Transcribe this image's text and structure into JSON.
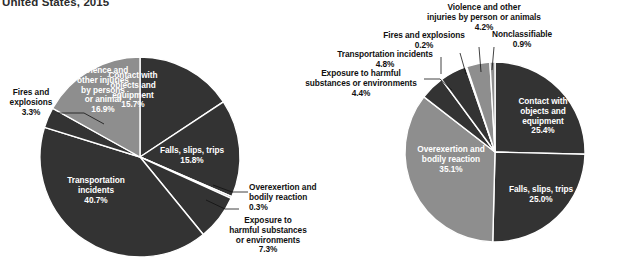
{
  "title": "United States, 2015",
  "colors": {
    "dark": "#333333",
    "light": "#8e8e8e",
    "separator": "#ffffff",
    "label_out": "#111111",
    "label_in": "#ffffff",
    "background": "#ffffff"
  },
  "chart_data": [
    {
      "type": "pie",
      "title": "Fatal occupational injuries by event",
      "name": "left-pie",
      "categories": [
        "Contact with objects and equipment",
        "Falls, slips, trips",
        "Overexertion and bodily reaction",
        "Exposure to harmful substances or environments",
        "Transportation incidents",
        "Fires and explosions",
        "Violence and other injuries by persons or animal"
      ],
      "values": [
        15.7,
        15.8,
        0.3,
        7.3,
        40.7,
        3.3,
        16.9
      ],
      "value_labels": [
        "15.7%",
        "15.8%",
        "0.3%",
        "7.3%",
        "40.7%",
        "3.3%",
        "16.9%"
      ],
      "slice_shades": [
        "dark",
        "dark",
        "light",
        "dark",
        "dark",
        "dark",
        "light"
      ],
      "start_angle": 0,
      "legend": "none"
    },
    {
      "type": "pie",
      "title": "Nonfatal occupational injuries by event",
      "name": "right-pie",
      "categories": [
        "Contact with objects and equipment",
        "Falls, slips, trips",
        "Overexertion and bodily reaction",
        "Exposure to harmful substances or environments",
        "Transportation incidents",
        "Fires and explosions",
        "Violence and other injuries by person or animals",
        "Nonclassifiable"
      ],
      "values": [
        25.4,
        25.0,
        35.1,
        4.4,
        4.8,
        0.2,
        4.2,
        0.9
      ],
      "value_labels": [
        "25.4%",
        "25.0%",
        "35.1%",
        "4.4%",
        "4.8%",
        "0.2%",
        "4.2%",
        "0.9%"
      ],
      "slice_shades": [
        "dark",
        "dark",
        "light",
        "dark",
        "dark",
        "light",
        "light",
        "light"
      ],
      "start_angle": 0,
      "legend": "none"
    }
  ],
  "left_labels": {
    "contact": "Contact with\nobjects and\nequipment\n15.7%",
    "falls": "Falls, slips, trips\n15.8%",
    "overexertion": "Overexertion and\nbodily reaction\n0.3%",
    "exposure": "Exposure to\nharmful substances\nor environments\n7.3%",
    "transportation": "Transportation\nincidents\n40.7%",
    "fires": "Fires and\nexplosions\n3.3%",
    "violence": "Violence and\nother injuries\nby persons\nor animal\n16.9%"
  },
  "right_labels": {
    "violence": "Violence and other\ninjuries by person or animals\n4.2%",
    "nonclassifiable": "Nonclassifiable\n0.9%",
    "fires": "Fires and explosions\n0.2%",
    "transportation": "Transportation incidents\n4.8%",
    "exposure": "Exposure to harmful\nsubstances or environments\n4.4%",
    "overexertion": "Overexertion and\nbodily reaction\n35.1%",
    "contact": "Contact with\nobjects and\nequipment\n25.4%",
    "falls": "Falls, slips, trips\n25.0%"
  }
}
